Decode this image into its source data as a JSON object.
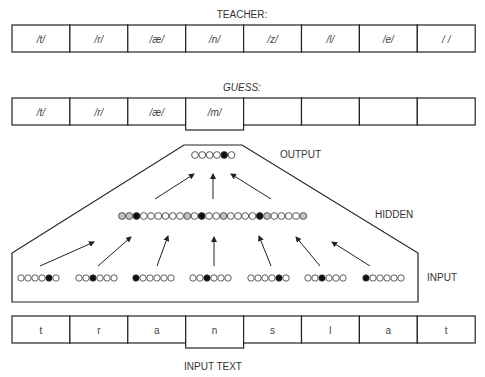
{
  "teacher": {
    "label": "TEACHER:",
    "cells": [
      "/t/",
      "/r/",
      "/æ/",
      "/n/",
      "/z/",
      "/l/",
      "/e/",
      "/ /"
    ]
  },
  "guess": {
    "label": "GUESS:",
    "cells": [
      "/t/",
      "/r/",
      "/æ/",
      "/m/",
      "",
      "",
      "",
      ""
    ],
    "highlighted_index": 3
  },
  "network": {
    "output_label": "OUTPUT",
    "hidden_label": "HIDDEN",
    "input_label": "INPUT",
    "output_units": [
      "w",
      "w",
      "w",
      "w",
      "b",
      "w"
    ],
    "hidden_units": [
      "g",
      "g",
      "b",
      "w",
      "w",
      "w",
      "w",
      "w",
      "w",
      "g",
      "w",
      "b",
      "w",
      "w",
      "g",
      "w",
      "w",
      "w",
      "w",
      "b",
      "g",
      "w",
      "w",
      "w",
      "w",
      "g"
    ],
    "input_groups": [
      [
        "w",
        "w",
        "w",
        "w",
        "b",
        "w"
      ],
      [
        "w",
        "w",
        "b",
        "w",
        "w",
        "w"
      ],
      [
        "b",
        "w",
        "w",
        "w",
        "w",
        "w"
      ],
      [
        "w",
        "w",
        "b",
        "w",
        "w",
        "w"
      ],
      [
        "w",
        "w",
        "w",
        "w",
        "b",
        "w"
      ],
      [
        "w",
        "w",
        "b",
        "w",
        "w",
        "w"
      ],
      [
        "b",
        "w",
        "w",
        "w",
        "w",
        "w"
      ]
    ],
    "colors": {
      "w": "#ffffff",
      "g": "#c4c4c4",
      "b": "#111111"
    }
  },
  "input_text": {
    "label": "INPUT TEXT",
    "cells": [
      "t",
      "r",
      "a",
      "n",
      "s",
      "l",
      "a",
      "t"
    ],
    "highlighted_index": 3
  }
}
